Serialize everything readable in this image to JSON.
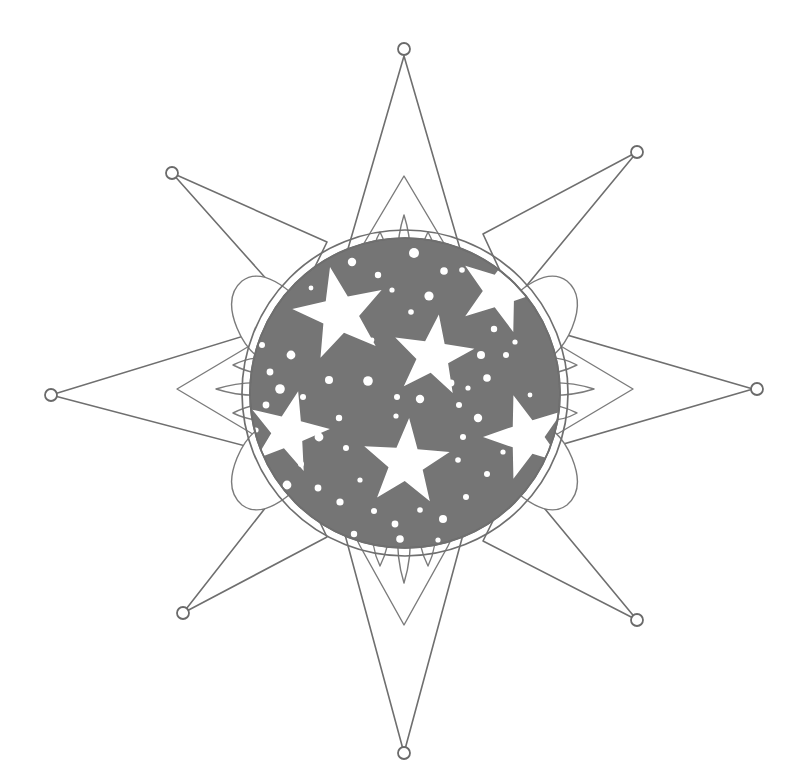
{
  "artwork": {
    "title": "Eight-pointed star with starry disc",
    "subject": "decorative-star-medallion",
    "style": "line-drawing-halftone",
    "background_color": "#ffffff",
    "ink_color": "#6f6f6f",
    "disc_fill_color": "#757575",
    "highlight_color": "#ffffff",
    "canvas": {
      "width": 806,
      "height": 780
    }
  },
  "composition": {
    "center": {
      "x": 405,
      "y": 393
    },
    "disc": {
      "name": "starry-disc",
      "radius": 155,
      "ring_radius": 163,
      "fill": "#757575"
    },
    "points": [
      {
        "name": "point-north",
        "angle_deg": -90,
        "tip": {
          "x": 404,
          "y": 56
        },
        "decorated": true,
        "half_width_deg": 13
      },
      {
        "name": "point-northeast",
        "angle_deg": -45,
        "tip": {
          "x": 637,
          "y": 152
        },
        "decorated": false,
        "half_width_deg": 10
      },
      {
        "name": "point-east",
        "angle_deg": 0,
        "tip": {
          "x": 753,
          "y": 389
        },
        "decorated": true,
        "half_width_deg": 13
      },
      {
        "name": "point-southeast",
        "angle_deg": 45,
        "tip": {
          "x": 637,
          "y": 620
        },
        "decorated": false,
        "half_width_deg": 10
      },
      {
        "name": "point-south",
        "angle_deg": 90,
        "tip": {
          "x": 404,
          "y": 753
        },
        "decorated": true,
        "half_width_deg": 13
      },
      {
        "name": "point-southwest",
        "angle_deg": 135,
        "tip": {
          "x": 183,
          "y": 613
        },
        "decorated": false,
        "half_width_deg": 10
      },
      {
        "name": "point-west",
        "angle_deg": 180,
        "tip": {
          "x": 51,
          "y": 395
        },
        "decorated": true,
        "half_width_deg": 13
      },
      {
        "name": "point-northwest",
        "angle_deg": -135,
        "tip": {
          "x": 172,
          "y": 173
        },
        "decorated": false,
        "half_width_deg": 10
      }
    ],
    "tip_rings": {
      "name": "tip-circle",
      "radius": 6,
      "count": 8,
      "positions": [
        {
          "x": 404,
          "y": 49
        },
        {
          "x": 637,
          "y": 152
        },
        {
          "x": 757,
          "y": 389
        },
        {
          "x": 637,
          "y": 620
        },
        {
          "x": 404,
          "y": 753
        },
        {
          "x": 183,
          "y": 613
        },
        {
          "x": 51,
          "y": 395
        },
        {
          "x": 172,
          "y": 173
        }
      ]
    },
    "stars": [
      {
        "name": "star-top-left",
        "cx": 340,
        "cy": 314,
        "r": 48,
        "rotation_deg": -12
      },
      {
        "name": "star-center",
        "cx": 433,
        "cy": 356,
        "r": 42,
        "rotation_deg": 8
      },
      {
        "name": "star-upper-right",
        "cx": 500,
        "cy": 291,
        "r": 43,
        "rotation_deg": 18
      },
      {
        "name": "star-right",
        "cx": 527,
        "cy": 437,
        "r": 44,
        "rotation_deg": -18
      },
      {
        "name": "star-bottom",
        "cx": 406,
        "cy": 463,
        "r": 45,
        "rotation_deg": 4
      },
      {
        "name": "star-left",
        "cx": 288,
        "cy": 432,
        "r": 42,
        "rotation_deg": 14
      }
    ],
    "speckles": [
      {
        "cx": 414,
        "cy": 253,
        "r": 5.0
      },
      {
        "cx": 352,
        "cy": 262,
        "r": 4.2
      },
      {
        "cx": 378,
        "cy": 275,
        "r": 3.2
      },
      {
        "cx": 392,
        "cy": 290,
        "r": 2.6
      },
      {
        "cx": 444,
        "cy": 271,
        "r": 3.8
      },
      {
        "cx": 462,
        "cy": 270,
        "r": 2.8
      },
      {
        "cx": 429,
        "cy": 296,
        "r": 4.6
      },
      {
        "cx": 411,
        "cy": 312,
        "r": 2.8
      },
      {
        "cx": 477,
        "cy": 245,
        "r": 2.4
      },
      {
        "cx": 291,
        "cy": 355,
        "r": 4.4
      },
      {
        "cx": 270,
        "cy": 372,
        "r": 3.4
      },
      {
        "cx": 262,
        "cy": 345,
        "r": 3.0
      },
      {
        "cx": 280,
        "cy": 389,
        "r": 4.8
      },
      {
        "cx": 303,
        "cy": 397,
        "r": 3.0
      },
      {
        "cx": 266,
        "cy": 405,
        "r": 3.4
      },
      {
        "cx": 329,
        "cy": 380,
        "r": 4.0
      },
      {
        "cx": 368,
        "cy": 381,
        "r": 4.8
      },
      {
        "cx": 397,
        "cy": 397,
        "r": 3.0
      },
      {
        "cx": 396,
        "cy": 416,
        "r": 2.6
      },
      {
        "cx": 420,
        "cy": 399,
        "r": 4.2
      },
      {
        "cx": 451,
        "cy": 383,
        "r": 3.4
      },
      {
        "cx": 459,
        "cy": 405,
        "r": 3.0
      },
      {
        "cx": 468,
        "cy": 388,
        "r": 2.6
      },
      {
        "cx": 487,
        "cy": 378,
        "r": 3.8
      },
      {
        "cx": 481,
        "cy": 355,
        "r": 4.0
      },
      {
        "cx": 506,
        "cy": 355,
        "r": 3.0
      },
      {
        "cx": 494,
        "cy": 329,
        "r": 3.2
      },
      {
        "cx": 515,
        "cy": 342,
        "r": 2.6
      },
      {
        "cx": 478,
        "cy": 418,
        "r": 4.2
      },
      {
        "cx": 463,
        "cy": 437,
        "r": 3.0
      },
      {
        "cx": 458,
        "cy": 460,
        "r": 2.8
      },
      {
        "cx": 339,
        "cy": 418,
        "r": 3.2
      },
      {
        "cx": 319,
        "cy": 437,
        "r": 4.4
      },
      {
        "cx": 346,
        "cy": 448,
        "r": 3.0
      },
      {
        "cx": 301,
        "cy": 464,
        "r": 3.0
      },
      {
        "cx": 287,
        "cy": 485,
        "r": 4.4
      },
      {
        "cx": 318,
        "cy": 488,
        "r": 3.4
      },
      {
        "cx": 340,
        "cy": 502,
        "r": 3.6
      },
      {
        "cx": 360,
        "cy": 480,
        "r": 2.6
      },
      {
        "cx": 374,
        "cy": 511,
        "r": 3.0
      },
      {
        "cx": 395,
        "cy": 524,
        "r": 3.4
      },
      {
        "cx": 420,
        "cy": 510,
        "r": 2.8
      },
      {
        "cx": 443,
        "cy": 519,
        "r": 4.0
      },
      {
        "cx": 466,
        "cy": 497,
        "r": 3.0
      },
      {
        "cx": 487,
        "cy": 474,
        "r": 3.0
      },
      {
        "cx": 503,
        "cy": 452,
        "r": 2.6
      },
      {
        "cx": 354,
        "cy": 534,
        "r": 3.2
      },
      {
        "cx": 400,
        "cy": 539,
        "r": 3.8
      },
      {
        "cx": 438,
        "cy": 540,
        "r": 2.6
      },
      {
        "cx": 256,
        "cy": 430,
        "r": 2.6
      },
      {
        "cx": 258,
        "cy": 455,
        "r": 3.0
      },
      {
        "cx": 530,
        "cy": 395,
        "r": 2.4
      },
      {
        "cx": 372,
        "cy": 340,
        "r": 2.4
      },
      {
        "cx": 311,
        "cy": 288,
        "r": 2.4
      }
    ]
  }
}
